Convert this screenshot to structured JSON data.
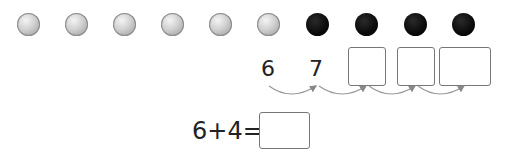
{
  "balls": {
    "gray_count": 6,
    "black_count": 4,
    "colors": {
      "gray": "#bdbdbd",
      "black": "#000000"
    }
  },
  "number_line": {
    "start": "6",
    "next": "7",
    "blank_boxes": 3
  },
  "equation": {
    "expression": "6+4=",
    "answer": ""
  }
}
